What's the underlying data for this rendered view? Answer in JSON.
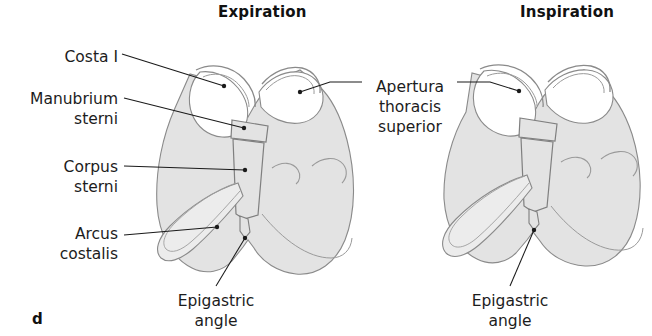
{
  "figure": {
    "panel_letter": "d",
    "titles": [
      {
        "id": "expiration",
        "text": "Expiration"
      },
      {
        "id": "inspiration",
        "text": "Inspiration"
      }
    ],
    "labels": {
      "costa_i": "Costa I",
      "manubrium_line1": "Manubrium",
      "manubrium_line2": "sterni",
      "corpus_line1": "Corpus",
      "corpus_line2": "sterni",
      "arcus_line1": "Arcus",
      "arcus_line2": "costalis",
      "apertura_line1": "Apertura",
      "apertura_line2": "thoracis",
      "apertura_line3": "superior",
      "epigastric_left_line1": "Epigastric",
      "epigastric_left_line2": "angle",
      "epigastric_right_line1": "Epigastric",
      "epigastric_right_line2": "angle"
    },
    "colors": {
      "background": "#ffffff",
      "text": "#1a1a1a",
      "leader_line": "#1a1a1a",
      "bone_fill": "#e3e3e3",
      "bone_fill_light": "#eeeeee",
      "bone_outline": "#8a8a8a",
      "rib_outline": "#909090"
    },
    "anatomy": {
      "expiration_view": "oblique thorax, ribs depressed, narrow epigastric angle",
      "inspiration_view": "oblique thorax, ribs elevated, widened epigastric angle"
    }
  }
}
